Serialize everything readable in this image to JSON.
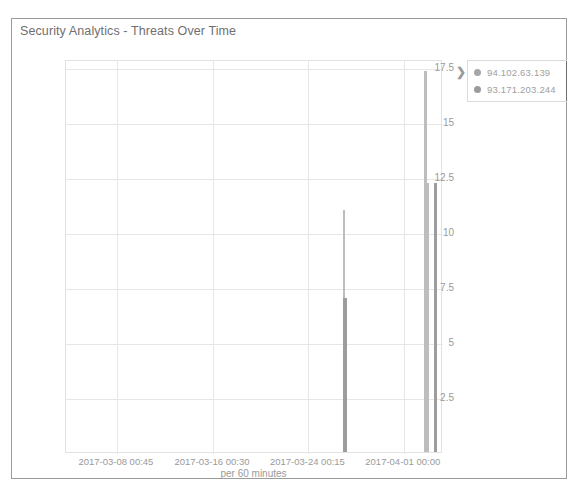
{
  "panel": {
    "title": "Security Analytics - Threats Over Time"
  },
  "legend": {
    "toggle_icon": "chevron-right-icon",
    "toggle_glyph": "❯",
    "items": [
      {
        "label": "94.102.63.139",
        "color": "#a6a6a6"
      },
      {
        "label": "93.171.203.244",
        "color": "#9b9b9b"
      }
    ]
  },
  "chart_data": {
    "type": "bar",
    "title": "Security Analytics - Threats Over Time",
    "xlabel": "per 60 minutes",
    "ylabel": "",
    "ylim": [
      0,
      17.85
    ],
    "grid": true,
    "legend_position": "right",
    "y_ticks": [
      "17.5",
      "15",
      "12.5",
      "10",
      "7.5",
      "5",
      "2.5"
    ],
    "y_tick_values": [
      17.5,
      15,
      12.5,
      10,
      7.5,
      5,
      2.5
    ],
    "x_ticks": [
      "2017-03-08 00:45",
      "2017-03-16 00:30",
      "2017-03-24 00:15",
      "2017-04-01 00:00"
    ],
    "x_tick_positions_pct": [
      13.5,
      39.0,
      64.3,
      89.6
    ],
    "series": [
      {
        "name": "94.102.63.139",
        "color": "#bdbdbd",
        "bars": [
          {
            "x_pct": 73.8,
            "value": 11.0,
            "width_px": 2
          },
          {
            "x_pct": 95.4,
            "value": 17.3,
            "width_px": 3
          },
          {
            "x_pct": 96.0,
            "value": 12.2,
            "width_px": 3
          }
        ]
      },
      {
        "name": "93.171.203.244",
        "color": "#9d9d9d",
        "bars": [
          {
            "x_pct": 73.9,
            "value": 7.0,
            "width_px": 4
          },
          {
            "x_pct": 98.1,
            "value": 12.2,
            "width_px": 3
          }
        ]
      }
    ]
  }
}
